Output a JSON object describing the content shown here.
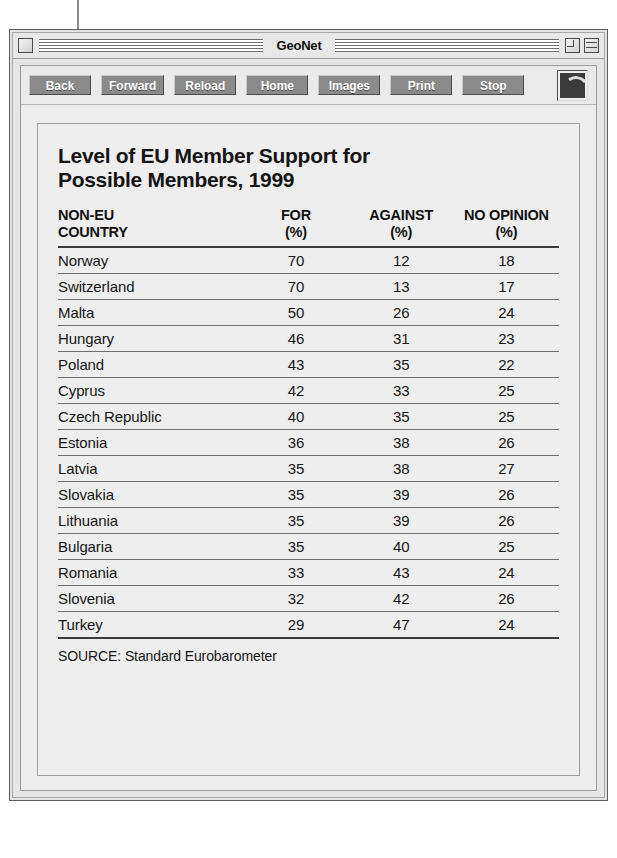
{
  "window": {
    "title": "GeoNet",
    "close_box": "close-box",
    "zoom_box": "zoom-box",
    "shade_box": "windowshade-box"
  },
  "toolbar": {
    "buttons": [
      {
        "label": "Back",
        "name": "back-button"
      },
      {
        "label": "Forward",
        "name": "forward-button"
      },
      {
        "label": "Reload",
        "name": "reload-button"
      },
      {
        "label": "Home",
        "name": "home-button"
      },
      {
        "label": "Images",
        "name": "images-button"
      },
      {
        "label": "Print",
        "name": "print-button"
      },
      {
        "label": "Stop",
        "name": "stop-button"
      }
    ],
    "logo": "browser-logo-button"
  },
  "document": {
    "title": "Level of EU Member Support for Possible Members, 1999",
    "source": "SOURCE: Standard Eurobarometer"
  },
  "chart_data": {
    "type": "table",
    "title": "Level of EU Member Support for Possible Members, 1999",
    "subtitle": "",
    "source": "SOURCE: Standard Eurobarometer",
    "columns": [
      {
        "line1": "NON-EU",
        "line2": "COUNTRY",
        "align": "left"
      },
      {
        "line1": "FOR",
        "line2": "(%)",
        "align": "center"
      },
      {
        "line1": "AGAINST",
        "line2": "(%)",
        "align": "center"
      },
      {
        "line1": "NO OPINION",
        "line2": "(%)",
        "align": "center"
      }
    ],
    "categories": [
      "Norway",
      "Switzerland",
      "Malta",
      "Hungary",
      "Poland",
      "Cyprus",
      "Czech Republic",
      "Estonia",
      "Latvia",
      "Slovakia",
      "Lithuania",
      "Bulgaria",
      "Romania",
      "Slovenia",
      "Turkey"
    ],
    "series": [
      {
        "name": "FOR (%)",
        "values": [
          70,
          70,
          50,
          46,
          43,
          42,
          40,
          36,
          35,
          35,
          35,
          35,
          33,
          32,
          29
        ]
      },
      {
        "name": "AGAINST (%)",
        "values": [
          12,
          13,
          26,
          31,
          35,
          33,
          35,
          38,
          38,
          39,
          39,
          40,
          43,
          42,
          47
        ]
      },
      {
        "name": "NO OPINION (%)",
        "values": [
          18,
          17,
          24,
          23,
          22,
          25,
          25,
          26,
          27,
          26,
          26,
          25,
          24,
          26,
          24
        ]
      }
    ],
    "rows": [
      {
        "country": "Norway",
        "for": "70",
        "against": "12",
        "no_opinion": "18"
      },
      {
        "country": "Switzerland",
        "for": "70",
        "against": "13",
        "no_opinion": "17"
      },
      {
        "country": "Malta",
        "for": "50",
        "against": "26",
        "no_opinion": "24"
      },
      {
        "country": "Hungary",
        "for": "46",
        "against": "31",
        "no_opinion": "23"
      },
      {
        "country": "Poland",
        "for": "43",
        "against": "35",
        "no_opinion": "22"
      },
      {
        "country": "Cyprus",
        "for": "42",
        "against": "33",
        "no_opinion": "25"
      },
      {
        "country": "Czech Republic",
        "for": "40",
        "against": "35",
        "no_opinion": "25"
      },
      {
        "country": "Estonia",
        "for": "36",
        "against": "38",
        "no_opinion": "26"
      },
      {
        "country": "Latvia",
        "for": "35",
        "against": "38",
        "no_opinion": "27"
      },
      {
        "country": "Slovakia",
        "for": "35",
        "against": "39",
        "no_opinion": "26"
      },
      {
        "country": "Lithuania",
        "for": "35",
        "against": "39",
        "no_opinion": "26"
      },
      {
        "country": "Bulgaria",
        "for": "35",
        "against": "40",
        "no_opinion": "25"
      },
      {
        "country": "Romania",
        "for": "33",
        "against": "43",
        "no_opinion": "24"
      },
      {
        "country": "Slovenia",
        "for": "32",
        "against": "42",
        "no_opinion": "26"
      },
      {
        "country": "Turkey",
        "for": "29",
        "against": "47",
        "no_opinion": "24"
      }
    ]
  },
  "colors": {
    "window_bg": "#e3e3e3",
    "button_face": "#8a8a8a",
    "button_text": "#ffffff",
    "rule": "#3a3a3a"
  }
}
